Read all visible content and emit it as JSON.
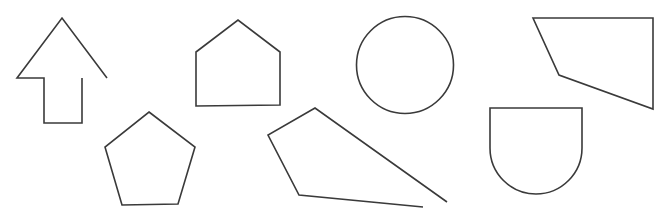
{
  "canvas": {
    "width": 668,
    "height": 219,
    "background": "#ffffff"
  },
  "style": {
    "stroke": "#3a3a3a"
  },
  "shapes": [
    {
      "name": "arrow-outline",
      "kind": "open-path",
      "d": "M107 78 L62 18 L17 78 L44 78 L44 123 L82 123 L82 78"
    },
    {
      "name": "house-pentagon",
      "kind": "polygon",
      "d": "M196 52 L238 20 L280 52 L280 105 L196 106 Z"
    },
    {
      "name": "circle",
      "kind": "circle",
      "cx": 405,
      "cy": 65,
      "r": 48.5
    },
    {
      "name": "quadrilateral",
      "kind": "polygon",
      "d": "M533 18 L653 18 L653 109 L559 75 Z"
    },
    {
      "name": "regular-pentagon",
      "kind": "polygon",
      "d": "M149 112 L195 147 L178 204 L122 205 L105 147 Z"
    },
    {
      "name": "open-kite",
      "kind": "open-path",
      "d": "M447 202 L315 108 L268 135 L299 195 L423 207"
    },
    {
      "name": "shield",
      "kind": "path",
      "d": "M490 108 L582 108 L582 148 A46 46 0 0 1 490 148 Z"
    }
  ]
}
